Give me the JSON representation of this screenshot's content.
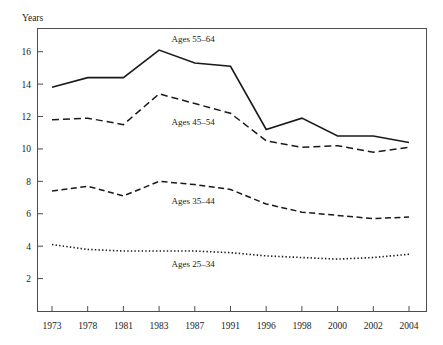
{
  "chart_data": {
    "type": "line",
    "title": "",
    "xlabel": "",
    "ylabel": "Years",
    "categories": [
      "1973",
      "1978",
      "1981",
      "1983",
      "1987",
      "1991",
      "1996",
      "1998",
      "2000",
      "2002",
      "2004"
    ],
    "ylim": [
      0,
      17.4
    ],
    "yticks": [
      2,
      4,
      6,
      8,
      10,
      12,
      14,
      16
    ],
    "ytick_labels": [
      "2",
      "4",
      "6",
      "8",
      "10",
      "12",
      "14",
      "16"
    ],
    "grid": false,
    "legend_position": "inline-annotations",
    "series": [
      {
        "name": "Ages 55–64",
        "label": "Ages 55–64",
        "style": "solid",
        "dasharray": "",
        "width": 1.6,
        "color": "#1a1a1a",
        "label_x": 1983,
        "label_value": 16.6,
        "values": [
          13.8,
          14.4,
          14.4,
          16.1,
          15.3,
          15.1,
          11.2,
          11.9,
          10.8,
          10.8,
          10.4
        ]
      },
      {
        "name": "Ages 45–54",
        "label": "Ages 45–54",
        "style": "dashed",
        "dasharray": "7,4",
        "width": 1.5,
        "color": "#1a1a1a",
        "label_x": 1983,
        "label_value": 11.5,
        "values": [
          11.8,
          11.9,
          11.5,
          13.4,
          12.8,
          12.2,
          10.5,
          10.1,
          10.2,
          9.8,
          10.1
        ]
      },
      {
        "name": "Ages 35–44",
        "label": "Ages 35–44",
        "style": "dashed",
        "dasharray": "6,3.5",
        "width": 1.5,
        "color": "#1a1a1a",
        "label_x": 1983,
        "label_value": 6.6,
        "values": [
          7.4,
          7.7,
          7.1,
          8.0,
          7.8,
          7.5,
          6.6,
          6.1,
          5.9,
          5.7,
          5.8
        ]
      },
      {
        "name": "Ages 25–34",
        "label": "Ages 25–34",
        "style": "dotted",
        "dasharray": "1.4,2.2",
        "width": 1.6,
        "color": "#1a1a1a",
        "label_x": 1983,
        "label_value": 2.7,
        "values": [
          4.1,
          3.8,
          3.7,
          3.7,
          3.7,
          3.6,
          3.4,
          3.3,
          3.2,
          3.3,
          3.5
        ]
      }
    ]
  },
  "colors": {
    "line": "#1a1a1a",
    "axis": "#4d4d4d",
    "background": "#ffffff"
  }
}
